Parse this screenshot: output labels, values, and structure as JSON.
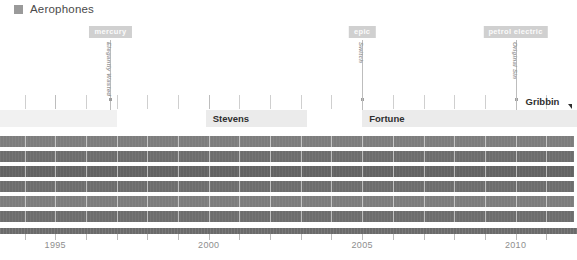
{
  "legend": {
    "label": "Aerophones",
    "swatch_color": "#9a9a9a",
    "icon": "square-marker-icon"
  },
  "colors": {
    "bar": "#6d6d6d",
    "bar_light": "#7d7d7d",
    "bar_dark": "#636363",
    "band_light": "#ebebeb",
    "band_lighter": "#f1f1f1",
    "pill": "#d0d0d0",
    "pill_text": "#fbfbfb",
    "axis": "#6a6a6a",
    "axis_label": "#8e8e8e",
    "tick": "#cfcfcf",
    "marker_line": "#bdbdbd",
    "band_text": "#2f2f2f",
    "vtitle": "#9b9b9b"
  },
  "chart_data": {
    "type": "bar",
    "title": "Aerophones",
    "xlabel": "",
    "ylabel": "",
    "xlim": [
      1993.2,
      2012.0
    ],
    "grid": true,
    "legend_position": "top-left",
    "x_ticks": [
      1995,
      2000,
      2005,
      2010
    ],
    "x_tick_labels": [
      "1995",
      "2000",
      "2005",
      "2010"
    ],
    "minor_tick_interval": 1,
    "markers": [
      {
        "pill": "mercury",
        "track": "Elegantly Wasted",
        "x": 1996.8
      },
      {
        "pill": "epic",
        "track": "Switch",
        "x": 2005.0
      },
      {
        "pill": "petrol electric",
        "track": "Original Sin",
        "x": 2010.0
      }
    ],
    "bands": [
      {
        "label": "",
        "x0": 1993.2,
        "x1": 1997.0
      },
      {
        "label": "Stevens",
        "x0": 1999.9,
        "x1": 2003.2
      },
      {
        "label": "Fortune",
        "x0": 2005.0,
        "x1": 2010.0
      },
      {
        "label": "Gribbin",
        "x0": 2010.0,
        "x1": 2012.0
      }
    ],
    "series": [
      {
        "name": "row-1",
        "x0": 1993.2,
        "x1": 2011.9,
        "shade": "light"
      },
      {
        "name": "row-2",
        "x0": 1993.2,
        "x1": 2011.9,
        "shade": "normal"
      },
      {
        "name": "row-3",
        "x0": 1993.2,
        "x1": 2011.9,
        "shade": "dark"
      },
      {
        "name": "row-4",
        "x0": 1993.2,
        "x1": 2011.9,
        "shade": "normal"
      },
      {
        "name": "row-5",
        "x0": 1993.2,
        "x1": 2011.9,
        "shade": "light"
      },
      {
        "name": "row-6",
        "x0": 1993.2,
        "x1": 2011.9,
        "shade": "normal"
      }
    ]
  }
}
